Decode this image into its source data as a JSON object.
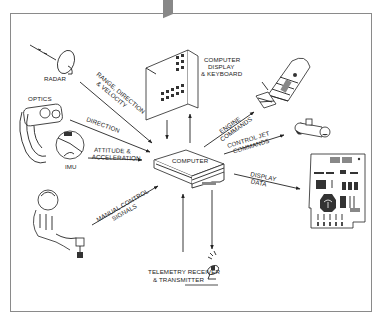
{
  "diagram": {
    "title": "",
    "center": {
      "label": "COMPUTER"
    },
    "nodes": {
      "radar": {
        "label": "RADAR"
      },
      "optics": {
        "label": "OPTICS"
      },
      "imu": {
        "label": "IMU"
      },
      "astronaut": {
        "label": ""
      },
      "dsky": {
        "label_lines": [
          "COMPUTER",
          "DISPLAY",
          "& KEYBOARD"
        ]
      },
      "spacecraft": {
        "label": ""
      },
      "rcs_thruster": {
        "label": ""
      },
      "display_panel": {
        "label": ""
      },
      "telemetry": {
        "label_lines": [
          "TELEMETRY RECEIVER",
          "& TRANSMITTER"
        ]
      }
    },
    "edges": [
      {
        "from": "radar",
        "to": "computer",
        "label_lines": [
          "RANGE, DIRECTION",
          "& VELOCITY"
        ]
      },
      {
        "from": "optics",
        "to": "computer",
        "label_lines": [
          "DIRECTION"
        ]
      },
      {
        "from": "imu",
        "to": "computer",
        "label_lines": [
          "ATTITUDE &",
          "ACCELERATION"
        ]
      },
      {
        "from": "astronaut",
        "to": "computer",
        "label_lines": [
          "MANUAL CONTROL",
          "SIGNALS"
        ]
      },
      {
        "from": "dsky",
        "to": "computer",
        "label_lines": []
      },
      {
        "from": "computer",
        "to": "dsky",
        "label_lines": []
      },
      {
        "from": "computer",
        "to": "spacecraft",
        "label_lines": [
          "ENGINE",
          "COMMANDS"
        ]
      },
      {
        "from": "computer",
        "to": "rcs_thruster",
        "label_lines": [
          "CONTROL JET",
          "COMMANDS"
        ]
      },
      {
        "from": "computer",
        "to": "display_panel",
        "label_lines": [
          "DISPLAY",
          "DATA"
        ]
      },
      {
        "from": "telemetry",
        "to": "computer",
        "label_lines": []
      },
      {
        "from": "computer",
        "to": "telemetry",
        "label_lines": []
      }
    ]
  }
}
